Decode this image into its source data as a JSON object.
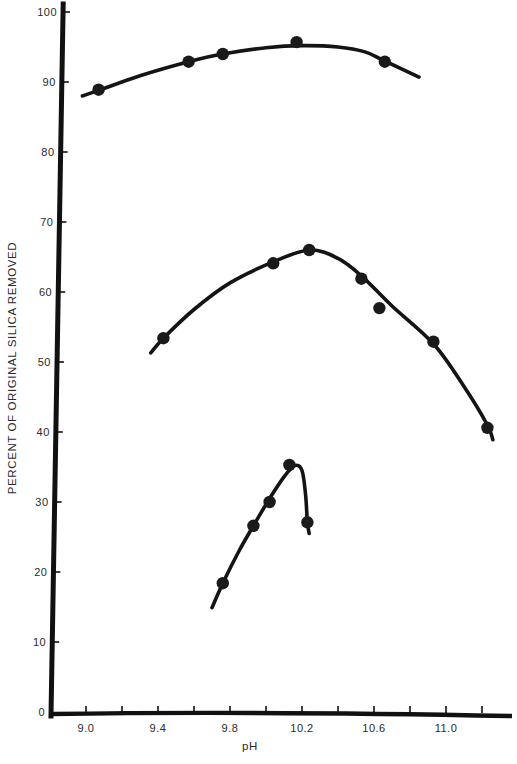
{
  "chart_data": {
    "type": "scatter",
    "title": "",
    "xlabel": "pH",
    "ylabel": "PERCENT OF ORIGINAL SILICA REMOVED",
    "xlim": [
      8.85,
      11.35
    ],
    "ylim": [
      0,
      100
    ],
    "x_ticks": [
      9.0,
      9.2,
      9.4,
      9.6,
      9.8,
      10.0,
      10.2,
      10.4,
      10.6,
      10.8,
      11.0,
      11.2
    ],
    "x_tick_labels": [
      "9.0",
      "",
      "9.4",
      "",
      "9.8",
      "",
      "10.2",
      "",
      "10.6",
      "",
      "11.0",
      ""
    ],
    "y_ticks": [
      0,
      10,
      20,
      30,
      40,
      50,
      60,
      70,
      80,
      90,
      100
    ],
    "y_tick_labels": [
      "0",
      "10",
      "20",
      "30",
      "40",
      "50",
      "60",
      "70",
      "80",
      "90",
      "100"
    ],
    "grid": false,
    "legend": null,
    "series": [
      {
        "name": "upper curve",
        "x": [
          9.07,
          9.57,
          9.76,
          10.17,
          10.66
        ],
        "y": [
          88.9,
          92.9,
          94.0,
          95.7,
          92.9
        ],
        "fit_curve": [
          [
            8.98,
            88.0
          ],
          [
            9.07,
            88.8
          ],
          [
            9.3,
            90.9
          ],
          [
            9.57,
            92.9
          ],
          [
            9.76,
            94.0
          ],
          [
            10.0,
            94.9
          ],
          [
            10.2,
            95.2
          ],
          [
            10.4,
            95.0
          ],
          [
            10.55,
            94.3
          ],
          [
            10.66,
            93.0
          ],
          [
            10.85,
            90.7
          ]
        ]
      },
      {
        "name": "middle curve",
        "x": [
          9.43,
          10.04,
          10.24,
          10.53,
          10.63,
          10.93,
          11.23
        ],
        "y": [
          53.4,
          64.1,
          66.0,
          61.9,
          57.7,
          52.9,
          40.6
        ],
        "fit_curve": [
          [
            9.36,
            51.3
          ],
          [
            9.43,
            53.4
          ],
          [
            9.6,
            57.5
          ],
          [
            9.8,
            61.3
          ],
          [
            10.04,
            64.3
          ],
          [
            10.24,
            66.0
          ],
          [
            10.4,
            64.8
          ],
          [
            10.53,
            62.3
          ],
          [
            10.7,
            58.0
          ],
          [
            10.93,
            52.6
          ],
          [
            11.1,
            46.5
          ],
          [
            11.23,
            41.0
          ],
          [
            11.26,
            38.9
          ]
        ]
      },
      {
        "name": "lower curve",
        "x": [
          9.76,
          9.93,
          10.02,
          10.13,
          10.23
        ],
        "y": [
          18.4,
          26.6,
          30.0,
          35.3,
          27.1
        ],
        "fit_curve": [
          [
            9.7,
            14.9
          ],
          [
            9.76,
            18.4
          ],
          [
            9.85,
            23.0
          ],
          [
            9.93,
            26.6
          ],
          [
            10.02,
            30.5
          ],
          [
            10.1,
            33.6
          ],
          [
            10.16,
            35.2
          ],
          [
            10.2,
            34.5
          ],
          [
            10.22,
            31.0
          ],
          [
            10.23,
            27.1
          ],
          [
            10.24,
            25.5
          ]
        ]
      }
    ]
  }
}
